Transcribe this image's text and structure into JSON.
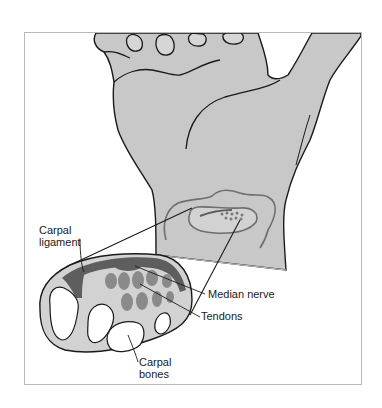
{
  "figure": {
    "labels": {
      "carpal_ligament_line1": "Carpal",
      "carpal_ligament_line2": "ligament",
      "median_nerve": "Median nerve",
      "tendons": "Tendons",
      "carpal_bones_line1": "Carpal",
      "carpal_bones_line2": "bones"
    },
    "colors": {
      "skin": "#c8c8c8",
      "cross_section": "#d2d2d2",
      "ligament": "#5e5e5e",
      "tendons": "#8a8a8a",
      "outline": "#1a1a1a",
      "bone_hole": "#ffffff",
      "frame_border": "#b9b9b9"
    }
  }
}
